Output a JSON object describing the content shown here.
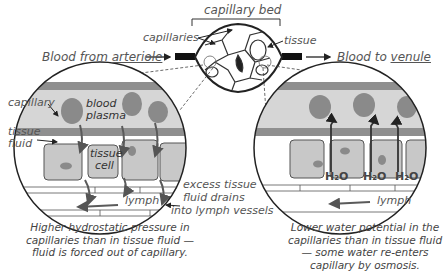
{
  "diagram": {
    "top": {
      "capillary_bed_label": "capillary bed",
      "capillaries_label": "capillaries",
      "tissue_label": "tissue",
      "blood_from_prefix": "Blood from ",
      "blood_from_link": "arteriole",
      "blood_to_prefix": "Blood to ",
      "blood_to_link": "venule"
    },
    "left_zoom": {
      "capillary_label": "capillary",
      "blood_plasma_label_1": "blood",
      "blood_plasma_label_2": "plasma",
      "tissue_fluid_label_1": "tissue",
      "tissue_fluid_label_2": "fluid",
      "tissue_cell_label_1": "tissue",
      "tissue_cell_label_2": "cell",
      "lymph_label": "lymph",
      "excess_label_1": "excess tissue",
      "excess_label_2": "fluid drains",
      "excess_label_3": "into lymph vessels",
      "caption_1": "Higher hydrostatic pressure in",
      "caption_2": "capillaries than in tissue fluid —",
      "caption_3": "fluid is forced out of capillary."
    },
    "right_zoom": {
      "water_label": "H₂O",
      "lymph_label": "lymph",
      "caption_1": "Lower water potential in the",
      "caption_2": "capillaries than in tissue fluid",
      "caption_3": "— some water re-enters",
      "caption_4": "capillary by osmosis."
    },
    "colors": {
      "cell_fill": "#c8c8c8",
      "blood_cell": "#8a8a8a",
      "plasma": "#d6d6d6",
      "wall": "#8f8f8f",
      "arrow": "#5a5a5a",
      "text": "#555555"
    }
  }
}
